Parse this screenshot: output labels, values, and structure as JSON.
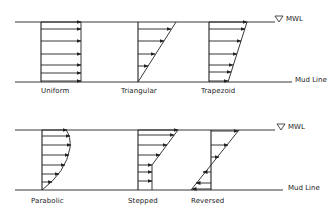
{
  "diagram": {
    "colors": {
      "line": "#222222",
      "background": "#ffffff"
    },
    "rows": [
      {
        "water_line_label": "MWL",
        "mud_line_label": "Mud Line",
        "profiles": [
          {
            "id": "uniform",
            "label": "Uniform"
          },
          {
            "id": "triangular",
            "label": "Triangular"
          },
          {
            "id": "trapezoid",
            "label": "Trapezoid"
          }
        ]
      },
      {
        "water_line_label": "MWL",
        "mud_line_label": "Mud Line",
        "profiles": [
          {
            "id": "parabolic",
            "label": "Parabolic"
          },
          {
            "id": "stepped",
            "label": "Stepped"
          },
          {
            "id": "reversed",
            "label": "Reversed"
          }
        ]
      }
    ],
    "icons": {
      "water_level": "triangle-down-icon"
    }
  }
}
